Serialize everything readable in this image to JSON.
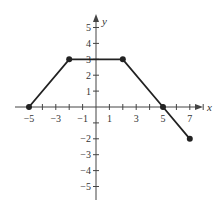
{
  "chart_data": {
    "type": "line",
    "title": "",
    "xlabel": "x",
    "ylabel": "y",
    "xlim": [
      -6,
      8
    ],
    "ylim": [
      -6,
      6
    ],
    "grid": false,
    "x_tick_labels": [
      "-5",
      "-3",
      "-1",
      "1",
      "3",
      "5",
      "7"
    ],
    "x_tick_values": [
      -5,
      -3,
      -1,
      1,
      3,
      5,
      7
    ],
    "x_minor_ticks": [
      -5,
      -4,
      -3,
      -2,
      -1,
      1,
      2,
      3,
      4,
      5,
      6,
      7
    ],
    "y_tick_labels": [
      "5",
      "4",
      "3",
      "2",
      "1",
      "-2",
      "-3",
      "-4",
      "-5"
    ],
    "y_tick_values": [
      5,
      4,
      3,
      2,
      1,
      -2,
      -3,
      -4,
      -5
    ],
    "y_minor_ticks": [
      5,
      4,
      3,
      2,
      1,
      -1,
      -2,
      -3,
      -4,
      -5
    ],
    "series": [
      {
        "name": "f(x)",
        "points": [
          [
            -5,
            0
          ],
          [
            -2,
            3
          ],
          [
            2,
            3
          ],
          [
            5,
            0
          ],
          [
            7,
            -2
          ]
        ],
        "markers": true
      }
    ],
    "colors": {
      "line": "#222222",
      "axis": "#444444"
    }
  }
}
